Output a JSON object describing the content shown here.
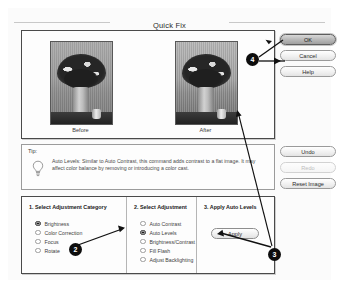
{
  "dialog": {
    "title": "Quick Fix"
  },
  "preview": {
    "before_label": "Before",
    "after_label": "After"
  },
  "action_buttons": [
    {
      "label": "OK",
      "state": "default"
    },
    {
      "label": "Cancel",
      "state": "normal"
    },
    {
      "label": "Help",
      "state": "normal"
    }
  ],
  "tip": {
    "label": "Tip:",
    "icon": "lightbulb-icon",
    "text": "Auto Levels: Similar to Auto Contrast, this command adds contrast to a flat image. It may affect color balance by removing or introducing a color cast."
  },
  "side_buttons": [
    {
      "label": "Undo",
      "state": "normal"
    },
    {
      "label": "Redo",
      "state": "disabled"
    },
    {
      "label": "Reset Image",
      "state": "normal"
    }
  ],
  "steps": {
    "category": {
      "heading": "1. Select Adjustment Category",
      "options": [
        {
          "label": "Brightness",
          "selected": true
        },
        {
          "label": "Color Correction",
          "selected": false
        },
        {
          "label": "Focus",
          "selected": false
        },
        {
          "label": "Rotate",
          "selected": false
        }
      ]
    },
    "adjustment": {
      "heading": "2. Select Adjustment",
      "options": [
        {
          "label": "Auto Contrast",
          "selected": false
        },
        {
          "label": "Auto Levels",
          "selected": true
        },
        {
          "label": "Brightness/Contrast",
          "selected": false
        },
        {
          "label": "Fill Flash",
          "selected": false
        },
        {
          "label": "Adjust Backlighting",
          "selected": false
        }
      ]
    },
    "apply": {
      "heading": "3. Apply Auto Levels",
      "button_label": "Apply"
    }
  },
  "callouts": [
    {
      "number": "2"
    },
    {
      "number": "3"
    },
    {
      "number": "4"
    }
  ],
  "colors": {
    "badge_fill": "#0d0d0d",
    "badge_text": "#ffffff",
    "panel_border": "#4a4a4a",
    "default_button": "#b9b9b9"
  }
}
